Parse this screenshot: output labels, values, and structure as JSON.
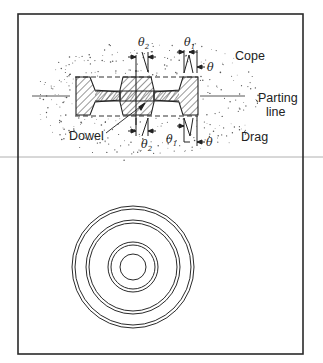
{
  "diagram": {
    "type": "casting-mold-cross-section",
    "top_panel": {
      "labels": {
        "cope": "Cope",
        "parting_line_1": "Parting",
        "parting_line_2": "line",
        "drag": "Drag",
        "dowel": "Dowel"
      },
      "angle_symbols": {
        "theta": "θ",
        "theta1_base": "θ",
        "theta1_sub": "1",
        "theta2_base": "θ",
        "theta2_sub": "2"
      }
    },
    "bottom_panel": {
      "description": "Top view of part: concentric circles",
      "circle_count": 8
    },
    "colors": {
      "line": "#2a2a2a",
      "divider": "#aaaaaa",
      "sand": "#555555"
    }
  }
}
